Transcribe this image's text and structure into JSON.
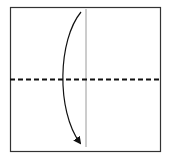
{
  "diagram": {
    "type": "origami-fold-step",
    "square": {
      "x": 10,
      "y": 7,
      "width": 151,
      "height": 145,
      "stroke": "#333333"
    },
    "center_crease": {
      "x": 86,
      "y1": 9,
      "y2": 147,
      "stroke": "#9a9a9a"
    },
    "fold_line": {
      "y": 79,
      "x1": 10,
      "x2": 161,
      "style": "dashed",
      "stroke": "#111111"
    },
    "fold_arrow": {
      "direction": "top-to-bottom",
      "stroke": "#111111"
    }
  }
}
